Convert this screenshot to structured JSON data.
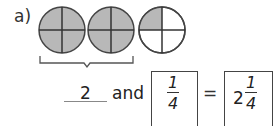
{
  "question": {
    "label": "a)"
  },
  "figure": {
    "circles": [
      {
        "parts": 4,
        "shaded_parts": 4,
        "center_x": 62,
        "center_y": 30,
        "radius": 23
      },
      {
        "parts": 4,
        "shaded_parts": 4,
        "center_x": 111,
        "center_y": 30,
        "radius": 23
      },
      {
        "parts": 4,
        "shaded_parts": 1,
        "center_x": 162,
        "center_y": 30,
        "radius": 23
      }
    ],
    "shade_color": "#b8b8b8",
    "line_color": "#333333",
    "bracket_spans": "first two circles"
  },
  "equation": {
    "wholes_answer": "2",
    "and_word": "and",
    "fraction_box": {
      "numerator": "1",
      "denominator": "4"
    },
    "equals": "=",
    "result_box": {
      "whole": "2",
      "numerator": "1",
      "denominator": "4"
    }
  }
}
